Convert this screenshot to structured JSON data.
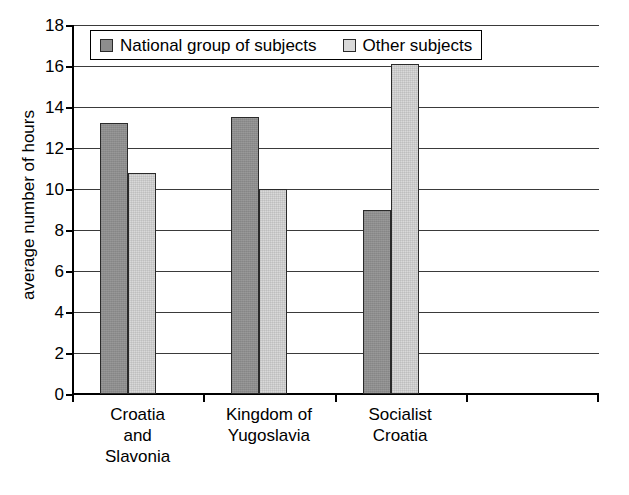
{
  "chart_data": {
    "type": "bar",
    "title": "",
    "xlabel": "",
    "ylabel": "average number of hours",
    "ylim": [
      0,
      18
    ],
    "ytick_step": 2,
    "yticks": [
      18,
      16,
      14,
      12,
      10,
      8,
      6,
      4,
      2,
      0
    ],
    "grid": true,
    "legend_position": "top-inside",
    "categories": [
      "Croatia\nand\nSlavonia",
      "Kingdom of\nYugoslavia",
      "Socialist\nCroatia"
    ],
    "series": [
      {
        "name": "National group of subjects",
        "color": "#8d8d8d",
        "values": [
          13.2,
          13.5,
          9.0
        ]
      },
      {
        "name": "Other subjects",
        "color": "#d9d9d9",
        "values": [
          10.8,
          10.0,
          16.1
        ]
      }
    ]
  },
  "axis": {
    "y_title": "average number of hours"
  }
}
